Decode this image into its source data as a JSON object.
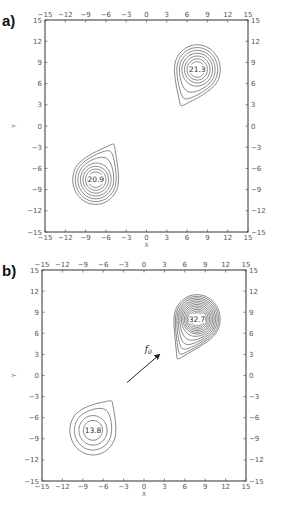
{
  "panels": [
    {
      "label": "a)",
      "box": {
        "left": 45,
        "top": 20,
        "right": 248,
        "bottom": 232
      },
      "xlabel": "X",
      "ylabel": "Y",
      "ticks": [
        "-15",
        "-12",
        "-9",
        "-6",
        "-3",
        "0",
        "3",
        "6",
        "9",
        "12",
        "15"
      ],
      "peaks": [
        {
          "value": "21.3",
          "x": 7.5,
          "y": 8.0,
          "levels": 7,
          "tail": [
            4.8,
            2.2
          ]
        },
        {
          "value": "20.9",
          "x": -7.5,
          "y": -7.6,
          "levels": 7,
          "tail": [
            -4.5,
            -1.9
          ]
        }
      ]
    },
    {
      "label": "b)",
      "box": {
        "left": 42,
        "top": 270,
        "right": 246,
        "bottom": 481
      },
      "xlabel": "X",
      "ylabel": "Y",
      "ticks": [
        "-15",
        "-12",
        "-9",
        "-6",
        "-3",
        "0",
        "3",
        "6",
        "9",
        "12",
        "15"
      ],
      "peaks": [
        {
          "value": "32.7",
          "x": 7.8,
          "y": 8.0,
          "levels": 12,
          "tail": [
            4.5,
            1.5
          ]
        },
        {
          "value": "13.8",
          "x": -7.5,
          "y": -7.8,
          "levels": 4,
          "tail": [
            -4.5,
            -3.2
          ]
        }
      ],
      "arrow": {
        "label": "f0",
        "from": [
          -2.5,
          -1.0
        ],
        "to": [
          2.3,
          3.0
        ]
      }
    }
  ],
  "chart_data": [
    {
      "type": "contour",
      "title": "a)",
      "xlabel": "X",
      "ylabel": "Y",
      "xlim": [
        -15,
        15
      ],
      "ylim": [
        -15,
        15
      ],
      "xticks": [
        -15,
        -12,
        -9,
        -6,
        -3,
        0,
        3,
        6,
        9,
        12,
        15
      ],
      "yticks": [
        -15,
        -12,
        -9,
        -6,
        -3,
        0,
        3,
        6,
        9,
        12,
        15
      ],
      "grid": false,
      "peaks": [
        {
          "label": "21.3",
          "x": 7.5,
          "y": 8.0,
          "contour_levels": 7
        },
        {
          "label": "20.9",
          "x": -7.5,
          "y": -7.6,
          "contour_levels": 7
        }
      ]
    },
    {
      "type": "contour",
      "title": "b)",
      "xlabel": "X",
      "ylabel": "Y",
      "xlim": [
        -15,
        15
      ],
      "ylim": [
        -15,
        15
      ],
      "xticks": [
        -15,
        -12,
        -9,
        -6,
        -3,
        0,
        3,
        6,
        9,
        12,
        15
      ],
      "yticks": [
        -15,
        -12,
        -9,
        -6,
        -3,
        0,
        3,
        6,
        9,
        12,
        15
      ],
      "grid": false,
      "peaks": [
        {
          "label": "32.7",
          "x": 7.8,
          "y": 8.0,
          "contour_levels": 12
        },
        {
          "label": "13.8",
          "x": -7.5,
          "y": -7.8,
          "contour_levels": 4
        }
      ],
      "annotations": [
        {
          "text": "f0",
          "type": "arrow",
          "from": [
            -2.5,
            -1.0
          ],
          "to": [
            2.3,
            3.0
          ]
        }
      ]
    }
  ]
}
